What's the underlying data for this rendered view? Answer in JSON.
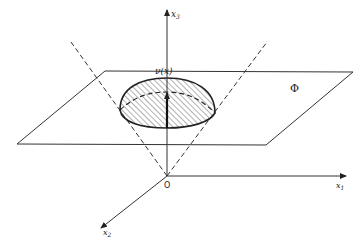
{
  "figure": {
    "axes": {
      "x1_label": "x",
      "x1_sub": "1",
      "x2_label": "x",
      "x2_sub": "2",
      "x3_label": "x",
      "x3_sub": "3",
      "origin_label": "O"
    },
    "normal_label": "ν(x)",
    "plane_label": "Φ",
    "colors": {
      "line": "#333333",
      "hatch": "#555555",
      "background": "#ffffff"
    }
  }
}
